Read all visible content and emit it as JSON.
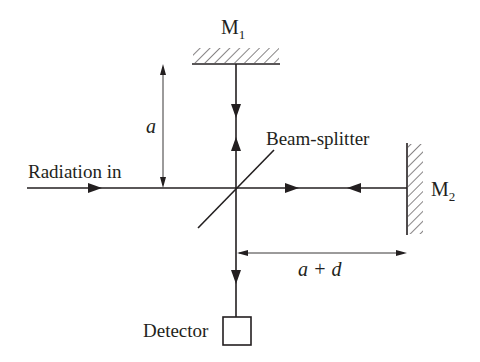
{
  "diagram": {
    "type": "Michelson interferometer schematic",
    "labels": {
      "mirror1_main": "M",
      "mirror1_sub": "1",
      "mirror2_main": "M",
      "mirror2_sub": "2",
      "beam_splitter": "Beam-splitter",
      "radiation_in": "Radiation in",
      "detector": "Detector",
      "dim_a": "a",
      "dim_a_plus_d": "a + d"
    },
    "colors": {
      "stroke": "#231f20",
      "background": "#ffffff"
    }
  }
}
